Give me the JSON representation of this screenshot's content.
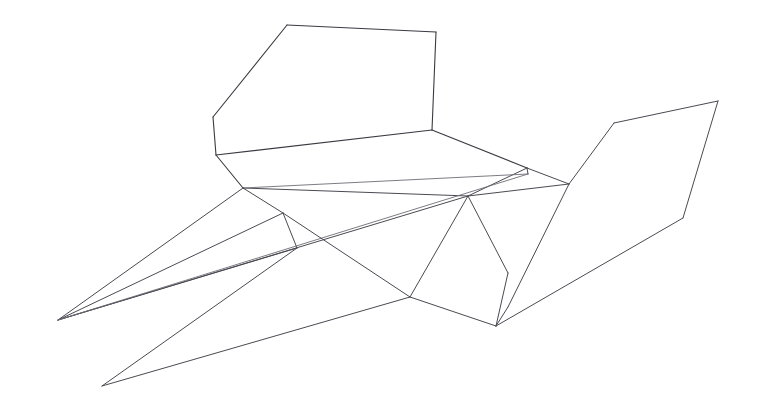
{
  "figure": {
    "background_color": "#ffffff",
    "stroke_color": "#4a4a52",
    "canvas": {
      "width": 758,
      "height": 409
    }
  },
  "geometry": {
    "vertices": {
      "backrest_top_left": [
        287,
        25
      ],
      "backrest_top_right": [
        436,
        32
      ],
      "backrest_right_lower": [
        432,
        130
      ],
      "backrest_left_upper": [
        213,
        117
      ],
      "backrest_left_lower": [
        216,
        155
      ],
      "seat_front_right": [
        527,
        168
      ],
      "seat_under_right": [
        528,
        174
      ],
      "seat_left_front": [
        243,
        188
      ],
      "apex_center": [
        468,
        196
      ],
      "left_tip_upper": [
        58,
        320
      ],
      "left_tip_lower": [
        102,
        386
      ],
      "leg_node_upper": [
        283,
        213
      ],
      "leg_node_lower": [
        297,
        248
      ],
      "base_left": [
        410,
        297
      ],
      "base_bottom": [
        496,
        326
      ],
      "mid_right": [
        508,
        273
      ],
      "wing_junction": [
        569,
        184
      ],
      "wing_upper_bend": [
        614,
        123
      ],
      "wing_top_right": [
        718,
        101
      ],
      "wing_lower_bend": [
        683,
        218
      ],
      "wing_bottom": [
        508,
        307
      ]
    },
    "edges": [
      {
        "name": "backrest-top-edge",
        "from": "backrest_top_left",
        "to": "backrest_top_right",
        "weight": "strong"
      },
      {
        "name": "backrest-right-edge",
        "from": "backrest_top_right",
        "to": "backrest_right_lower",
        "weight": "strong"
      },
      {
        "name": "backrest-upper-left-edge",
        "from": "backrest_top_left",
        "to": "backrest_left_upper",
        "weight": "strong"
      },
      {
        "name": "backrest-left-edge",
        "from": "backrest_left_upper",
        "to": "backrest_left_lower",
        "weight": "strong"
      },
      {
        "name": "seat-back-edge",
        "from": "backrest_left_lower",
        "to": "backrest_right_lower",
        "weight": "strong"
      },
      {
        "name": "seat-right-edge",
        "from": "backrest_right_lower",
        "to": "seat_front_right",
        "weight": "strong"
      },
      {
        "name": "seat-left-edge",
        "from": "backrest_left_lower",
        "to": "seat_left_front",
        "weight": "strong"
      },
      {
        "name": "seat-front-edge",
        "from": "seat_left_front",
        "to": "apex_center",
        "weight": "normal"
      },
      {
        "name": "seat-front-edge-right",
        "from": "apex_center",
        "to": "seat_front_right",
        "weight": "normal"
      },
      {
        "name": "seat-underside-edge",
        "from": "seat_left_front",
        "to": "seat_under_right",
        "weight": "faint"
      },
      {
        "name": "seat-thickness-edge",
        "from": "seat_front_right",
        "to": "seat_under_right",
        "weight": "normal"
      },
      {
        "name": "leg-upper-strut",
        "from": "seat_left_front",
        "to": "leg_node_upper",
        "weight": "normal"
      },
      {
        "name": "leg-node-connector",
        "from": "leg_node_upper",
        "to": "leg_node_lower",
        "weight": "normal"
      },
      {
        "name": "runner-upper-front",
        "from": "left_tip_upper",
        "to": "seat_left_front",
        "weight": "normal"
      },
      {
        "name": "runner-upper-mid",
        "from": "left_tip_upper",
        "to": "leg_node_upper",
        "weight": "normal"
      },
      {
        "name": "runner-lower-mid",
        "from": "left_tip_upper",
        "to": "leg_node_lower",
        "weight": "normal"
      },
      {
        "name": "runner-long-to-apex",
        "from": "left_tip_upper",
        "to": "apex_center",
        "weight": "normal"
      },
      {
        "name": "runner-long-to-under",
        "from": "left_tip_upper",
        "to": "seat_under_right",
        "weight": "faint"
      },
      {
        "name": "runner-lower-diagonal",
        "from": "leg_node_upper",
        "to": "base_left",
        "weight": "normal"
      },
      {
        "name": "runner-bottom-rail",
        "from": "leg_node_lower",
        "to": "left_tip_lower",
        "weight": "normal"
      },
      {
        "name": "base-lower-rail",
        "from": "left_tip_lower",
        "to": "base_left",
        "weight": "normal"
      },
      {
        "name": "base-left-to-apex",
        "from": "base_left",
        "to": "apex_center",
        "weight": "normal"
      },
      {
        "name": "base-left-to-bottom",
        "from": "base_left",
        "to": "base_bottom",
        "weight": "normal"
      },
      {
        "name": "apex-to-mid-right",
        "from": "apex_center",
        "to": "mid_right",
        "weight": "normal"
      },
      {
        "name": "mid-right-to-bottom",
        "from": "mid_right",
        "to": "base_bottom",
        "weight": "normal"
      },
      {
        "name": "apex-to-wing-junction",
        "from": "apex_center",
        "to": "wing_junction",
        "weight": "normal"
      },
      {
        "name": "seat-right-to-junction",
        "from": "seat_front_right",
        "to": "wing_junction",
        "weight": "normal"
      },
      {
        "name": "wing-inner-edge",
        "from": "wing_junction",
        "to": "wing_upper_bend",
        "weight": "normal"
      },
      {
        "name": "wing-top-edge",
        "from": "wing_upper_bend",
        "to": "wing_top_right",
        "weight": "normal"
      },
      {
        "name": "wing-outer-edge",
        "from": "wing_top_right",
        "to": "wing_lower_bend",
        "weight": "normal"
      },
      {
        "name": "wing-lower-edge",
        "from": "wing_lower_bend",
        "to": "base_bottom",
        "weight": "normal"
      },
      {
        "name": "wing-fold-edge",
        "from": "wing_junction",
        "to": "wing_bottom",
        "weight": "normal"
      },
      {
        "name": "wing-bottom-to-base",
        "from": "wing_bottom",
        "to": "base_bottom",
        "weight": "normal"
      }
    ]
  }
}
